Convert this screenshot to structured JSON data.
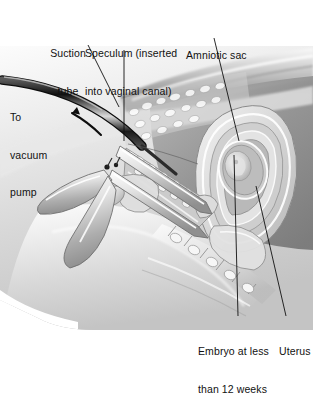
{
  "figure": {
    "type": "medical-illustration",
    "style": "grayscale airbrush anatomical cross-section",
    "background_color": "#ffffff",
    "ink_color": "#111111",
    "illustration_bounds": {
      "x": 0,
      "y": 40,
      "width": 313,
      "height": 290
    }
  },
  "labels": [
    {
      "id": "suction-tube",
      "text": "Suction\ntube",
      "line1": "Suction",
      "line2": "tube",
      "x": 62,
      "y": 22,
      "align": "center",
      "leader": {
        "x1": 88,
        "y1": 45,
        "x2": 119,
        "y2": 107
      }
    },
    {
      "id": "to-vacuum-pump",
      "text": "To\nvacuum\npump",
      "line1": "To",
      "line2": "vacuum",
      "line3": "pump",
      "x": 10,
      "y": 86,
      "align": "left",
      "leader": null
    },
    {
      "id": "speculum",
      "text": "Speculum (inserted\ninto vaginal canal)",
      "line1": "Speculum (inserted",
      "line2": "into vaginal canal)",
      "x": 85,
      "y": 22,
      "align": "left",
      "leader": {
        "x1": 124,
        "y1": 50,
        "x2": 124,
        "y2": 141
      }
    },
    {
      "id": "amniotic-sac",
      "text": "Amniotic sac",
      "line1": "Amniotic sac",
      "x": 186,
      "y": 24,
      "align": "left",
      "leader": {
        "x1": 214,
        "y1": 38,
        "x2": 239,
        "y2": 141
      }
    },
    {
      "id": "embryo",
      "text": "Embryo at less\nthan 12 weeks",
      "line1": "Embryo at less",
      "line2": "than 12 weeks",
      "x": 198,
      "y": 320,
      "align": "left",
      "leader": {
        "x1": 238,
        "y1": 316,
        "x2": 234,
        "y2": 155
      }
    },
    {
      "id": "uterus",
      "text": "Uterus",
      "line1": "Uterus",
      "x": 279,
      "y": 320,
      "align": "left",
      "leader": {
        "x1": 286,
        "y1": 316,
        "x2": 256,
        "y2": 186
      }
    }
  ],
  "annotations": {
    "flow_arrow": {
      "name": "suction-flow-arrow",
      "direction": "up-left",
      "meaning": "aspirated contents flow toward vacuum pump"
    }
  },
  "anatomy_parts": [
    "abdominal wall",
    "sacrum and vertebrae",
    "uterus",
    "amniotic sac",
    "embryo",
    "cervix",
    "vaginal canal",
    "bladder",
    "rectum",
    "pubic bone"
  ],
  "instruments": [
    "suction tube (cannula)",
    "bivalve speculum"
  ]
}
